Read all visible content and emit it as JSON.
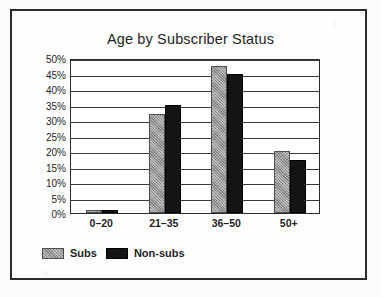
{
  "chart_data": {
    "type": "bar",
    "title": "Age by Subscriber Status",
    "xlabel": "",
    "ylabel": "",
    "categories": [
      "0–20",
      "21–35",
      "36–50",
      "50+"
    ],
    "series": [
      {
        "name": "Subs",
        "color": "#969696",
        "values": [
          1,
          32,
          47.5,
          20
        ]
      },
      {
        "name": "Non-subs",
        "color": "#141414",
        "values": [
          1,
          35,
          45,
          17
        ]
      }
    ],
    "ylim": [
      0,
      50
    ],
    "ytick_step": 5,
    "ytick_labels": [
      "50%",
      "45%",
      "40%",
      "35%",
      "30%",
      "25%",
      "20%",
      "15%",
      "10%",
      "5%",
      "0%"
    ],
    "grid": true,
    "legend_position": "bottom-left",
    "value_suffix": "%"
  }
}
